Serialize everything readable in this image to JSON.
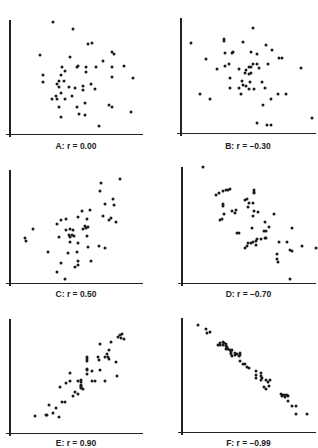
{
  "chart_data": [
    {
      "type": "scatter",
      "title": "A: r = 0.00",
      "r": 0.0,
      "xlabel": "",
      "ylabel": "",
      "xlim": [
        0,
        100
      ],
      "ylim": [
        0,
        100
      ],
      "grid": false,
      "points": [
        [
          31,
          98
        ],
        [
          46,
          92
        ],
        [
          21,
          69
        ],
        [
          58,
          79
        ],
        [
          61,
          80
        ],
        [
          44,
          67
        ],
        [
          76,
          72
        ],
        [
          78,
          70
        ],
        [
          69,
          64
        ],
        [
          23,
          51
        ],
        [
          23,
          45
        ],
        [
          38,
          58
        ],
        [
          40,
          55
        ],
        [
          37,
          51
        ],
        [
          49,
          58
        ],
        [
          50,
          59
        ],
        [
          56,
          58
        ],
        [
          64,
          58
        ],
        [
          56,
          54
        ],
        [
          76,
          58
        ],
        [
          85,
          59
        ],
        [
          76,
          50
        ],
        [
          92,
          49
        ],
        [
          35,
          46
        ],
        [
          34,
          43
        ],
        [
          39,
          46
        ],
        [
          35,
          41
        ],
        [
          43,
          41
        ],
        [
          48,
          40
        ],
        [
          54,
          42
        ],
        [
          54,
          38
        ],
        [
          60,
          43
        ],
        [
          63,
          39
        ],
        [
          37,
          35
        ],
        [
          33,
          33
        ],
        [
          30,
          30
        ],
        [
          34,
          30
        ],
        [
          40,
          30
        ],
        [
          45,
          33
        ],
        [
          55,
          27
        ],
        [
          49,
          23
        ],
        [
          35,
          23
        ],
        [
          51,
          17
        ],
        [
          55,
          16
        ],
        [
          37,
          14
        ],
        [
          74,
          25
        ],
        [
          76,
          23
        ],
        [
          91,
          19
        ],
        [
          66,
          6
        ]
      ]
    },
    {
      "type": "scatter",
      "title": "B: r = -0.30",
      "r": -0.3,
      "xlabel": "",
      "ylabel": "",
      "xlim": [
        0,
        100
      ],
      "ylim": [
        0,
        100
      ],
      "grid": false,
      "points": [
        [
          5,
          78
        ],
        [
          52,
          91
        ],
        [
          30,
          82
        ],
        [
          30,
          80
        ],
        [
          45,
          79
        ],
        [
          62,
          76
        ],
        [
          67,
          72
        ],
        [
          17,
          64
        ],
        [
          31,
          69
        ],
        [
          36,
          69
        ],
        [
          37,
          70
        ],
        [
          51,
          70
        ],
        [
          55,
          68
        ],
        [
          72,
          65
        ],
        [
          74,
          65
        ],
        [
          64,
          60
        ],
        [
          31,
          58
        ],
        [
          34,
          60
        ],
        [
          25,
          55
        ],
        [
          42,
          55
        ],
        [
          47,
          54
        ],
        [
          49,
          57
        ],
        [
          51,
          57
        ],
        [
          52,
          60
        ],
        [
          55,
          60
        ],
        [
          57,
          56
        ],
        [
          46,
          52
        ],
        [
          49,
          51
        ],
        [
          51,
          52
        ],
        [
          35,
          47
        ],
        [
          44,
          45
        ],
        [
          50,
          44
        ],
        [
          59,
          44
        ],
        [
          89,
          56
        ],
        [
          45,
          41
        ],
        [
          47,
          40
        ],
        [
          42,
          39
        ],
        [
          35,
          39
        ],
        [
          49,
          38
        ],
        [
          53,
          38
        ],
        [
          61,
          39
        ],
        [
          12,
          33
        ],
        [
          20,
          29
        ],
        [
          43,
          33
        ],
        [
          77,
          33
        ],
        [
          66,
          29
        ],
        [
          71,
          33
        ],
        [
          60,
          24
        ],
        [
          55,
          8
        ],
        [
          63,
          6
        ],
        [
          66,
          6
        ],
        [
          97,
          12
        ]
      ]
    },
    {
      "type": "scatter",
      "title": "C: r = 0.50",
      "r": 0.5,
      "xlabel": "",
      "ylabel": "",
      "xlim": [
        0,
        100
      ],
      "ylim": [
        0,
        100
      ],
      "grid": false,
      "points": [
        [
          82,
          92
        ],
        [
          68,
          88
        ],
        [
          67,
          81
        ],
        [
          77,
          74
        ],
        [
          71,
          70
        ],
        [
          78,
          69
        ],
        [
          59,
          64
        ],
        [
          53,
          63
        ],
        [
          50,
          58
        ],
        [
          69,
          59
        ],
        [
          75,
          57
        ],
        [
          57,
          56
        ],
        [
          74,
          55
        ],
        [
          79,
          54
        ],
        [
          34,
          52
        ],
        [
          37,
          55
        ],
        [
          41,
          56
        ],
        [
          55,
          50
        ],
        [
          56,
          48
        ],
        [
          58,
          49
        ],
        [
          44,
          47
        ],
        [
          46,
          46
        ],
        [
          41,
          46
        ],
        [
          54,
          47
        ],
        [
          15,
          47
        ],
        [
          9,
          39
        ],
        [
          10,
          37
        ],
        [
          35,
          40
        ],
        [
          43,
          42
        ],
        [
          45,
          42
        ],
        [
          44,
          40
        ],
        [
          47,
          41
        ],
        [
          57,
          41
        ],
        [
          44,
          36
        ],
        [
          50,
          35
        ],
        [
          58,
          31
        ],
        [
          66,
          32
        ],
        [
          71,
          30
        ],
        [
          27,
          27
        ],
        [
          42,
          26
        ],
        [
          49,
          27
        ],
        [
          50,
          19
        ],
        [
          60,
          19
        ],
        [
          37,
          17
        ],
        [
          50,
          15
        ],
        [
          48,
          13
        ],
        [
          34,
          9
        ],
        [
          40,
          3
        ]
      ]
    },
    {
      "type": "scatter",
      "title": "D: r = -0.70",
      "r": -0.7,
      "xlabel": "",
      "ylabel": "",
      "xlim": [
        0,
        100
      ],
      "ylim": [
        0,
        100
      ],
      "grid": false,
      "points": [
        [
          14,
          100
        ],
        [
          34,
          81
        ],
        [
          33,
          80
        ],
        [
          31,
          80
        ],
        [
          29,
          79
        ],
        [
          26,
          77
        ],
        [
          24,
          76
        ],
        [
          53,
          80
        ],
        [
          53,
          78
        ],
        [
          53,
          77
        ],
        [
          46,
          71
        ],
        [
          47,
          72
        ],
        [
          49,
          69
        ],
        [
          52,
          69
        ],
        [
          29,
          68
        ],
        [
          29,
          66
        ],
        [
          48,
          65
        ],
        [
          36,
          62
        ],
        [
          39,
          63
        ],
        [
          38,
          60
        ],
        [
          30,
          59
        ],
        [
          28,
          55
        ],
        [
          27,
          54
        ],
        [
          53,
          62
        ],
        [
          56,
          61
        ],
        [
          52,
          57
        ],
        [
          68,
          59
        ],
        [
          61,
          52
        ],
        [
          64,
          48
        ],
        [
          62,
          44
        ],
        [
          60,
          44
        ],
        [
          51,
          47
        ],
        [
          40,
          43
        ],
        [
          41,
          43
        ],
        [
          58,
          37
        ],
        [
          55,
          37
        ],
        [
          54,
          36
        ],
        [
          52,
          35
        ],
        [
          48,
          34
        ],
        [
          50,
          34
        ],
        [
          47,
          31
        ],
        [
          46,
          30
        ],
        [
          62,
          38
        ],
        [
          61,
          38
        ],
        [
          54,
          32
        ],
        [
          82,
          47
        ],
        [
          72,
          35
        ],
        [
          78,
          35
        ],
        [
          89,
          31
        ],
        [
          80,
          28
        ],
        [
          82,
          27
        ],
        [
          100,
          30
        ],
        [
          70,
          24
        ],
        [
          70,
          20
        ],
        [
          71,
          17
        ],
        [
          80,
          3
        ]
      ]
    },
    {
      "type": "scatter",
      "title": "E: r = 0.90",
      "r": 0.9,
      "xlabel": "",
      "ylabel": "",
      "xlim": [
        0,
        100
      ],
      "ylim": [
        0,
        100
      ],
      "grid": false,
      "points": [
        [
          82,
          86
        ],
        [
          84,
          87
        ],
        [
          81,
          84
        ],
        [
          83,
          83
        ],
        [
          85,
          82
        ],
        [
          75,
          80
        ],
        [
          67,
          78
        ],
        [
          74,
          73
        ],
        [
          72,
          69
        ],
        [
          71,
          66
        ],
        [
          73,
          66
        ],
        [
          74,
          65
        ],
        [
          65,
          66
        ],
        [
          66,
          64
        ],
        [
          57,
          66
        ],
        [
          57,
          65
        ],
        [
          57,
          63
        ],
        [
          57,
          56
        ],
        [
          57,
          55
        ],
        [
          61,
          54
        ],
        [
          67,
          55
        ],
        [
          79,
          62
        ],
        [
          80,
          50
        ],
        [
          57,
          51
        ],
        [
          44,
          52
        ],
        [
          50,
          45
        ],
        [
          44,
          45
        ],
        [
          52,
          46
        ],
        [
          52,
          44
        ],
        [
          52,
          42
        ],
        [
          52,
          41
        ],
        [
          52,
          40
        ],
        [
          52,
          39
        ],
        [
          61,
          45
        ],
        [
          63,
          45
        ],
        [
          54,
          38
        ],
        [
          71,
          45
        ],
        [
          36,
          40
        ],
        [
          41,
          43
        ],
        [
          48,
          35
        ],
        [
          46,
          32
        ],
        [
          50,
          34
        ],
        [
          38,
          27
        ],
        [
          40,
          27
        ],
        [
          28,
          24
        ],
        [
          33,
          21
        ],
        [
          31,
          17
        ],
        [
          26,
          15
        ],
        [
          25,
          15
        ],
        [
          35,
          13
        ],
        [
          17,
          14
        ]
      ]
    },
    {
      "type": "scatter",
      "title": "F: r = -0.99",
      "r": -0.99,
      "xlabel": "",
      "ylabel": "",
      "xlim": [
        0,
        100
      ],
      "ylim": [
        0,
        100
      ],
      "grid": false,
      "points": [
        [
          10,
          94
        ],
        [
          16,
          90
        ],
        [
          17,
          87
        ],
        [
          19,
          88
        ],
        [
          27,
          78
        ],
        [
          29,
          79
        ],
        [
          30,
          78
        ],
        [
          31,
          77
        ],
        [
          25,
          76
        ],
        [
          27,
          76
        ],
        [
          29,
          76
        ],
        [
          31,
          75
        ],
        [
          32,
          74
        ],
        [
          33,
          73
        ],
        [
          31,
          73
        ],
        [
          34,
          72
        ],
        [
          36,
          72
        ],
        [
          35,
          70
        ],
        [
          35,
          68
        ],
        [
          38,
          69
        ],
        [
          40,
          68
        ],
        [
          42,
          69
        ],
        [
          42,
          67
        ],
        [
          41,
          66
        ],
        [
          38,
          67
        ],
        [
          36,
          66
        ],
        [
          42,
          62
        ],
        [
          44,
          59
        ],
        [
          46,
          59
        ],
        [
          47,
          57
        ],
        [
          49,
          56
        ],
        [
          54,
          53
        ],
        [
          58,
          51
        ],
        [
          54,
          50
        ],
        [
          58,
          49
        ],
        [
          59,
          47
        ],
        [
          54,
          47
        ],
        [
          58,
          45
        ],
        [
          62,
          45
        ],
        [
          65,
          45
        ],
        [
          63,
          43
        ],
        [
          64,
          40
        ],
        [
          60,
          39
        ],
        [
          62,
          37
        ],
        [
          73,
          33
        ],
        [
          74,
          31
        ],
        [
          75,
          32
        ],
        [
          76,
          32
        ],
        [
          78,
          32
        ],
        [
          79,
          31
        ],
        [
          76,
          30
        ],
        [
          79,
          27
        ],
        [
          82,
          22
        ],
        [
          85,
          22
        ],
        [
          85,
          15
        ],
        [
          93,
          15
        ]
      ]
    }
  ],
  "panels": [
    {
      "label": "A: r = 0.00"
    },
    {
      "label": "B: r = –0.30"
    },
    {
      "label": "C: r = 0.50"
    },
    {
      "label": "D: r = –0.70"
    },
    {
      "label": "E: r = 0.90"
    },
    {
      "label": "F: r = –0.99"
    }
  ]
}
